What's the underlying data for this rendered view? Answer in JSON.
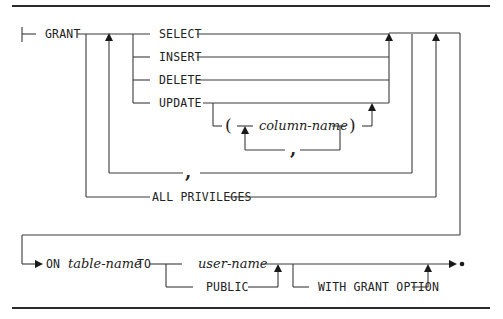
{
  "diagram": {
    "type": "syntax-railroad-diagram",
    "statement": "GRANT",
    "keywords": {
      "grant": "GRANT",
      "select": "SELECT",
      "insert": "INSERT",
      "delete": "DELETE",
      "update": "UPDATE",
      "all_privileges": "ALL PRIVILEGES",
      "on": "ON",
      "to": "TO",
      "public": "PUBLIC",
      "with_grant_option": "WITH GRANT OPTION"
    },
    "variables": {
      "column_name": "column-name",
      "table_name": "table-name",
      "user_name": "user-name"
    },
    "punctuation": {
      "open_paren": "(",
      "close_paren": ")",
      "privilege_separator": ",",
      "column_separator": ","
    },
    "colors": {
      "line": "#3a3a3a",
      "text": "#222222",
      "background": "#ffffff"
    }
  }
}
